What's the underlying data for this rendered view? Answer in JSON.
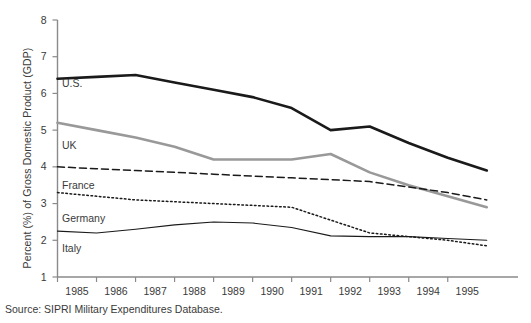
{
  "figure": {
    "title_partial": "",
    "source_note": "Source: SIPRI Military Expenditures Database."
  },
  "axes": {
    "y_axis_title": "Percent (%) of Gross Domestic Product (GDP)",
    "y_ticks": [
      "8",
      "7",
      "6",
      "5",
      "4",
      "3",
      "2",
      "1"
    ],
    "x_ticks": [
      "1985",
      "1986",
      "1987",
      "1988",
      "1989",
      "1990",
      "1991",
      "1992",
      "1993",
      "1994",
      "1995"
    ]
  },
  "series_labels": {
    "us": "U.S.",
    "uk": "UK",
    "france": "France",
    "germany": "Germany",
    "italy": "Italy"
  },
  "colors": {
    "us_line": "#1a1a1a",
    "uk_line": "#999999",
    "france_line": "#1a1a1a",
    "germany_line": "#1a1a1a",
    "italy_line": "#1a1a1a",
    "axis": "#8a8a8a",
    "text": "#3a3a3a",
    "background": "#ffffff"
  },
  "chart_data": {
    "type": "line",
    "title": "",
    "xlabel": "",
    "ylabel": "Percent (%) of Gross Domestic Product (GDP)",
    "xlim": [
      1984.0,
      1995.8
    ],
    "ylim": [
      1,
      8
    ],
    "grid": false,
    "legend": "inline-left-labels",
    "x": [
      1984,
      1985,
      1986,
      1987,
      1988,
      1989,
      1990,
      1991,
      1992,
      1993,
      1994,
      1995
    ],
    "series": [
      {
        "name": "U.S.",
        "style": "solid-thick",
        "color": "#1a1a1a",
        "values": [
          6.4,
          6.45,
          6.5,
          6.3,
          6.1,
          5.9,
          5.6,
          5.0,
          5.1,
          4.65,
          4.25,
          3.9
        ]
      },
      {
        "name": "UK",
        "style": "solid-thick",
        "color": "#999999",
        "values": [
          5.2,
          5.0,
          4.8,
          4.55,
          4.2,
          4.2,
          4.2,
          4.35,
          3.85,
          3.5,
          3.2,
          2.9
        ]
      },
      {
        "name": "France",
        "style": "dashed",
        "color": "#1a1a1a",
        "values": [
          4.0,
          3.95,
          3.9,
          3.85,
          3.8,
          3.75,
          3.7,
          3.65,
          3.6,
          3.45,
          3.3,
          3.1
        ]
      },
      {
        "name": "Germany",
        "style": "dotted",
        "color": "#1a1a1a",
        "values": [
          3.3,
          3.2,
          3.1,
          3.05,
          3.0,
          2.95,
          2.9,
          2.55,
          2.2,
          2.1,
          2.0,
          1.85
        ]
      },
      {
        "name": "Italy",
        "style": "solid-thin",
        "color": "#1a1a1a",
        "values": [
          2.25,
          2.2,
          2.3,
          2.42,
          2.5,
          2.47,
          2.35,
          2.12,
          2.1,
          2.1,
          2.05,
          2.0
        ]
      }
    ]
  }
}
